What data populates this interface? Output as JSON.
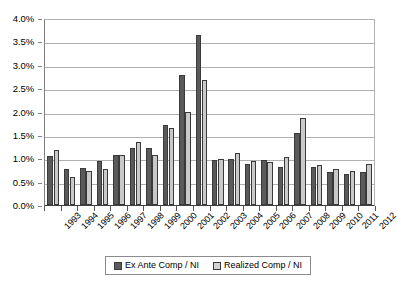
{
  "chart_data": {
    "type": "bar",
    "title": "",
    "subtitle": "",
    "xlabel": "",
    "ylabel": "",
    "ylim": [
      0,
      4.0
    ],
    "y_unit": "%",
    "grid": true,
    "legend_position": "bottom",
    "y_ticks": [
      "0.0%",
      "0.5%",
      "1.0%",
      "1.5%",
      "2.0%",
      "2.5%",
      "3.0%",
      "3.5%",
      "4.0%"
    ],
    "y_tick_values": [
      0.0,
      0.5,
      1.0,
      1.5,
      2.0,
      2.5,
      3.0,
      3.5,
      4.0
    ],
    "categories": [
      "1993",
      "1994",
      "1995",
      "1996",
      "1997",
      "1998",
      "1999",
      "2000",
      "2001",
      "2002",
      "2003",
      "2004",
      "2005",
      "2006",
      "2007",
      "2008",
      "2009",
      "2010",
      "2011",
      "2012"
    ],
    "series": [
      {
        "name": "Ex Ante Comp / NI",
        "color": "#5a5a5a",
        "values": [
          1.05,
          0.78,
          0.8,
          0.95,
          1.08,
          1.23,
          1.23,
          1.72,
          2.78,
          3.63,
          0.97,
          0.98,
          0.87,
          0.97,
          0.82,
          1.55,
          0.82,
          0.7,
          0.67,
          0.7
        ]
      },
      {
        "name": "Realized Comp / NI",
        "color": "#c9c9c9",
        "values": [
          1.18,
          0.6,
          0.72,
          0.77,
          1.08,
          1.35,
          1.06,
          1.65,
          2.0,
          2.67,
          0.98,
          1.12,
          0.95,
          0.93,
          1.02,
          1.87,
          0.85,
          0.77,
          0.73,
          0.88
        ]
      }
    ]
  },
  "legend": {
    "items": [
      {
        "label": "Ex Ante Comp / NI"
      },
      {
        "label": "Realized Comp / NI"
      }
    ]
  }
}
